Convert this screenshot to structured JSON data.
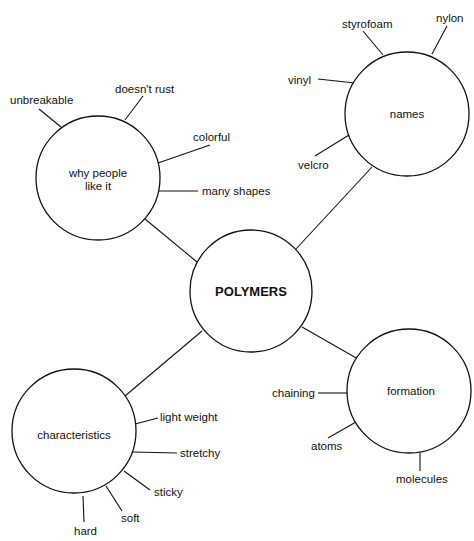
{
  "diagram": {
    "type": "concept-map",
    "center": {
      "label": "POLYMERS",
      "cx": 251,
      "cy": 291,
      "r": 61
    },
    "nodes": [
      {
        "id": "why",
        "label_line1": "why people",
        "label_line2": "like it",
        "cx": 98,
        "cy": 178,
        "r": 62,
        "leaves": [
          "unbreakable",
          "doesn't rust",
          "colorful",
          "many shapes"
        ]
      },
      {
        "id": "names",
        "label": "names",
        "cx": 407,
        "cy": 114,
        "r": 62,
        "leaves": [
          "styrofoam",
          "nylon",
          "vinyl",
          "velcro"
        ]
      },
      {
        "id": "characteristics",
        "label": "characteristics",
        "cx": 74,
        "cy": 431,
        "r": 62,
        "leaves": [
          "light weight",
          "stretchy",
          "sticky",
          "soft",
          "hard"
        ]
      },
      {
        "id": "formation",
        "label": "formation",
        "cx": 409,
        "cy": 391,
        "r": 62,
        "leaves": [
          "chaining",
          "atoms",
          "molecules"
        ]
      }
    ]
  }
}
